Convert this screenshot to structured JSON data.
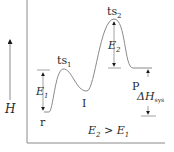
{
  "diagram": {
    "type": "energy-profile",
    "y_axis_label": "H",
    "states": {
      "reactant": "r",
      "transition_state_1_base": "ts",
      "transition_state_1_sub": "1",
      "intermediate": "I",
      "transition_state_2_base": "ts",
      "transition_state_2_sub": "2",
      "product": "P"
    },
    "arrows": {
      "e1_base": "E",
      "e1_sub": "1",
      "e2_base": "E",
      "e2_sub": "2",
      "dh_base": "ΔH",
      "dh_sub": "sys"
    },
    "condition": {
      "left_base": "E",
      "left_sub": "2",
      "op": " > ",
      "right_base": "E",
      "right_sub": "1"
    },
    "colors": {
      "line": "#8a8a8a",
      "arrow": "#1a1a1a",
      "text": "#2a2a2a"
    }
  }
}
